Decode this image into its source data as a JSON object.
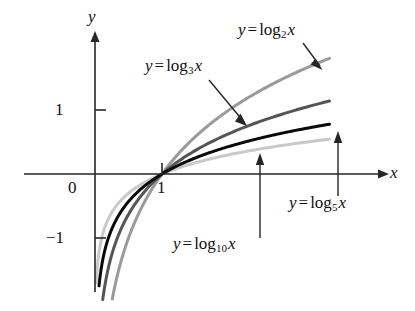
{
  "figure": {
    "background": "#ffffff",
    "width": 415,
    "height": 311
  },
  "axes": {
    "x_axis_label": "x",
    "y_axis_label": "y",
    "x_ticks": [
      {
        "value": 1,
        "label": "1"
      }
    ],
    "y_ticks": [
      {
        "value": 1,
        "label": "1"
      },
      {
        "value": 0,
        "label": "0"
      },
      {
        "value": -1,
        "label": "−1"
      }
    ],
    "axis_color": "#262626"
  },
  "annotations": [
    {
      "id": "log2",
      "lhs": "y",
      "eq": "=",
      "fn": "log",
      "base": "2",
      "arg": "x",
      "text": "y = log₂x"
    },
    {
      "id": "log3",
      "lhs": "y",
      "eq": "=",
      "fn": "log",
      "base": "3",
      "arg": "x",
      "text": "y = log₃x"
    },
    {
      "id": "log5",
      "lhs": "y",
      "eq": "=",
      "fn": "log",
      "base": "5",
      "arg": "x",
      "text": "y = log₅x"
    },
    {
      "id": "log10",
      "lhs": "y",
      "eq": "=",
      "fn": "log",
      "base": "10",
      "arg": "x",
      "text": "y = log₁₀x"
    }
  ],
  "chart_data": {
    "type": "line",
    "title": "",
    "xlabel": "x",
    "ylabel": "y",
    "xlim": [
      0,
      3.55
    ],
    "ylim": [
      -2.35,
      1.95
    ],
    "grid": false,
    "legend": "annotated-arrows",
    "series": [
      {
        "name": "y = log₂x",
        "base": 2,
        "color": "#9a9a9a",
        "width": 3.0,
        "x": [
          0.17,
          0.2,
          0.25,
          0.3,
          0.35,
          0.4,
          0.5,
          0.6,
          0.7,
          0.8,
          0.9,
          1.0,
          1.2,
          1.4,
          1.6,
          1.8,
          2.0,
          2.2,
          2.4,
          2.6,
          2.8,
          3.0,
          3.2,
          3.4,
          3.5
        ],
        "y": [
          -2.56,
          -2.32,
          -2.0,
          -1.74,
          -1.51,
          -1.32,
          -1.0,
          -0.74,
          -0.51,
          -0.32,
          -0.15,
          0.0,
          0.26,
          0.49,
          0.68,
          0.85,
          1.0,
          1.14,
          1.26,
          1.38,
          1.49,
          1.58,
          1.68,
          1.77,
          1.81
        ]
      },
      {
        "name": "y = log₃x",
        "base": 3,
        "color": "#555555",
        "width": 3.0,
        "x": [
          0.11,
          0.14,
          0.18,
          0.22,
          0.28,
          0.35,
          0.45,
          0.55,
          0.7,
          0.85,
          1.0,
          1.2,
          1.5,
          1.8,
          2.1,
          2.4,
          2.7,
          3.0,
          3.2,
          3.4,
          3.5
        ],
        "y": [
          -2.01,
          -1.79,
          -1.56,
          -1.38,
          -1.16,
          -0.96,
          -0.73,
          -0.54,
          -0.32,
          -0.15,
          0.0,
          0.17,
          0.37,
          0.53,
          0.68,
          0.8,
          0.9,
          1.0,
          1.06,
          1.11,
          1.14
        ]
      },
      {
        "name": "y = log₅x",
        "base": 5,
        "color": "#0a0a0a",
        "width": 3.0,
        "x": [
          0.06,
          0.08,
          0.11,
          0.15,
          0.2,
          0.27,
          0.35,
          0.45,
          0.6,
          0.75,
          0.9,
          1.0,
          1.3,
          1.6,
          2.0,
          2.4,
          2.8,
          3.1,
          3.3,
          3.5
        ],
        "y": [
          -1.75,
          -1.57,
          -1.37,
          -1.18,
          -1.0,
          -0.81,
          -0.65,
          -0.5,
          -0.32,
          -0.18,
          -0.07,
          0.0,
          0.16,
          0.29,
          0.43,
          0.54,
          0.64,
          0.7,
          0.74,
          0.78
        ]
      },
      {
        "name": "y = log₁₀x",
        "base": 10,
        "color": "#c9c9c9",
        "width": 3.0,
        "x": [
          0.02,
          0.03,
          0.05,
          0.08,
          0.12,
          0.18,
          0.25,
          0.35,
          0.5,
          0.65,
          0.8,
          1.0,
          1.4,
          1.8,
          2.2,
          2.6,
          3.0,
          3.3,
          3.5
        ],
        "y": [
          -1.7,
          -1.52,
          -1.3,
          -1.1,
          -0.92,
          -0.74,
          -0.6,
          -0.46,
          -0.3,
          -0.19,
          -0.1,
          0.0,
          0.15,
          0.26,
          0.34,
          0.41,
          0.48,
          0.52,
          0.54
        ]
      }
    ]
  }
}
